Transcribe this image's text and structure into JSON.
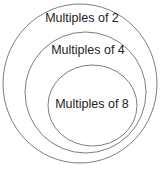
{
  "diagram": {
    "type": "nested-sets",
    "sets": [
      {
        "label": "Multiples of 2",
        "cx": 80,
        "cy": 83.5,
        "rx": 77,
        "ry": 79.5,
        "label_x": 82,
        "label_y": 11
      },
      {
        "label": "Multiples of 4",
        "cx": 85.5,
        "cy": 92.5,
        "rx": 60.5,
        "ry": 60.5,
        "label_x": 88,
        "label_y": 43
      },
      {
        "label": "Multiples of 8",
        "cx": 92.5,
        "cy": 105.5,
        "rx": 44.5,
        "ry": 40.5,
        "label_x": 92,
        "label_y": 97
      }
    ],
    "stroke_color": "#6e6e6e"
  }
}
